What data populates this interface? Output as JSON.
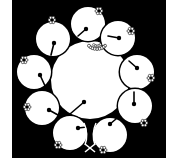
{
  "image": {
    "description": "Monochrome family crest (kamon) of a large central fruit surrounded by nine smaller fruits with stems",
    "background_color": "#ffffff",
    "frame_color": "#000000",
    "fill_color": "#ffffff"
  },
  "frame": {
    "x": 12,
    "y": 0,
    "width": 154,
    "height": 158
  },
  "center_fruit": {
    "cx": 90,
    "cy": 80,
    "r": 39,
    "stem_dot": {
      "x": 84,
      "y": 102
    },
    "stem_end": {
      "x": 70,
      "y": 114
    },
    "calyx": {
      "x": 97,
      "y": 47
    }
  },
  "satellite_fruits": [
    {
      "name": "top",
      "cx": 88,
      "cy": 24,
      "r": 17,
      "dot": {
        "x": 86,
        "y": 29
      },
      "stem_end": {
        "x": 78,
        "y": 36
      },
      "calyx": {
        "x": 99,
        "y": 11
      }
    },
    {
      "name": "upper-right",
      "cx": 118,
      "cy": 38,
      "r": 17,
      "dot": {
        "x": 119,
        "y": 38
      },
      "stem_end": {
        "x": 108,
        "y": 36
      },
      "calyx": {
        "x": 131,
        "y": 31
      }
    },
    {
      "name": "right",
      "cx": 137,
      "cy": 72,
      "r": 17,
      "dot": {
        "x": 137,
        "y": 68
      },
      "stem_end": {
        "x": 129,
        "y": 61
      },
      "calyx": {
        "x": 151,
        "y": 78
      }
    },
    {
      "name": "lower-right",
      "cx": 135,
      "cy": 106,
      "r": 17,
      "dot": {
        "x": 134,
        "y": 104
      },
      "stem_end": {
        "x": 134,
        "y": 92
      },
      "calyx": {
        "x": 144,
        "y": 123
      }
    },
    {
      "name": "bottom-right",
      "cx": 110,
      "cy": 135,
      "r": 17,
      "dot": {
        "x": 110,
        "y": 124
      },
      "stem_end": {
        "x": 116,
        "y": 119
      },
      "calyx": {
        "x": 103,
        "y": 150
      }
    },
    {
      "name": "bottom-left",
      "cx": 70,
      "cy": 133,
      "r": 17,
      "dot": {
        "x": 78,
        "y": 128
      },
      "stem_end": {
        "x": 87,
        "y": 127
      },
      "calyx": {
        "x": 58,
        "y": 145
      }
    },
    {
      "name": "left-lower",
      "cx": 42,
      "cy": 108,
      "r": 17,
      "dot": {
        "x": 49,
        "y": 110
      },
      "stem_end": {
        "x": 58,
        "y": 115
      },
      "calyx": {
        "x": 27,
        "y": 107
      }
    },
    {
      "name": "left",
      "cx": 34,
      "cy": 72,
      "r": 17,
      "dot": {
        "x": 40,
        "y": 75
      },
      "stem_end": {
        "x": 46,
        "y": 88
      },
      "calyx": {
        "x": 24,
        "y": 60
      }
    },
    {
      "name": "upper-left",
      "cx": 53,
      "cy": 39,
      "r": 17,
      "dot": {
        "x": 54,
        "y": 43
      },
      "stem_end": {
        "x": 51,
        "y": 55
      },
      "calyx": {
        "x": 52,
        "y": 20
      }
    }
  ],
  "bottom_ornament": {
    "x": 90,
    "y": 148,
    "description": "crossed stems at bottom center"
  }
}
